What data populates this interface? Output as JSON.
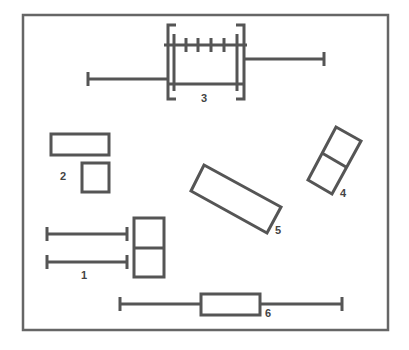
{
  "diagram": {
    "type": "component-layout",
    "colors": {
      "stroke": "#555555",
      "frame": "#666666",
      "label": "#444444",
      "background": "#ffffff"
    },
    "components": [
      {
        "id": "1",
        "label": "1",
        "description": "two horizontal bars with end caps next to a two-cell vertical box"
      },
      {
        "id": "2",
        "label": "2",
        "description": "wide rectangle above a small square"
      },
      {
        "id": "3",
        "label": "3",
        "description": "bracketed frame with ticked top rail and two side arms with end caps"
      },
      {
        "id": "4",
        "label": "4",
        "description": "tilted two-cell rectangle"
      },
      {
        "id": "5",
        "label": "5",
        "description": "tilted long rectangle"
      },
      {
        "id": "6",
        "label": "6",
        "description": "horizontal bar with end caps through a rectangle"
      }
    ]
  }
}
